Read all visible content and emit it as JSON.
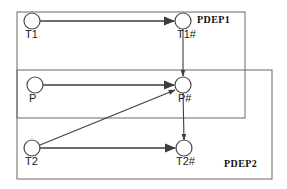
{
  "diagram": {
    "type": "petri-net-dependency-graph",
    "width": 287,
    "height": 189,
    "background_color": "#ffffff",
    "line_color": "#3d3d3d",
    "box_color": "#6b6b6b",
    "node_stroke_color": "#4a4a4a",
    "node_fill_color": "#ffffff",
    "label_color": "#1a1a1a"
  },
  "regions": [
    {
      "id": "pdep1",
      "label": "PDEP1",
      "x": 17,
      "y": 12,
      "width": 228,
      "height": 106,
      "label_x": 197,
      "label_y": 16
    },
    {
      "id": "pdep2",
      "label": "PDEP2",
      "x": 17,
      "y": 70,
      "width": 255,
      "height": 109,
      "label_x": 224,
      "label_y": 160
    }
  ],
  "nodes": [
    {
      "id": "t1",
      "label": "T1",
      "cx": 32,
      "cy": 21,
      "r": 8,
      "label_x": 25,
      "label_y": 30
    },
    {
      "id": "t1h",
      "label": "T1#",
      "cx": 183,
      "cy": 21,
      "r": 8,
      "label_x": 177,
      "label_y": 30
    },
    {
      "id": "p",
      "label": "P",
      "cx": 35,
      "cy": 85,
      "r": 8,
      "label_x": 29,
      "label_y": 94
    },
    {
      "id": "ph",
      "label": "P#",
      "cx": 183,
      "cy": 85,
      "r": 8,
      "label_x": 178,
      "label_y": 94
    },
    {
      "id": "t2",
      "label": "T2",
      "cx": 32,
      "cy": 148,
      "r": 8,
      "label_x": 25,
      "label_y": 157
    },
    {
      "id": "t2h",
      "label": "T2#",
      "cx": 184,
      "cy": 148,
      "r": 8,
      "label_x": 176,
      "label_y": 157
    }
  ],
  "edges": [
    {
      "id": "t1-to-t1h",
      "from": "T1",
      "to": "T1#",
      "x1": 40,
      "y1": 21,
      "x2": 174,
      "y2": 21,
      "style": "thick"
    },
    {
      "id": "p-to-ph",
      "from": "P",
      "to": "P#",
      "x1": 43,
      "y1": 85,
      "x2": 174,
      "y2": 85,
      "style": "thick"
    },
    {
      "id": "t2-to-t2h",
      "from": "T2",
      "to": "T2#",
      "x1": 40,
      "y1": 148,
      "x2": 175,
      "y2": 148,
      "style": "thick"
    },
    {
      "id": "t1h-to-ph",
      "from": "T1#",
      "to": "P#",
      "x1": 183,
      "y1": 29,
      "x2": 183,
      "y2": 76,
      "style": "thin"
    },
    {
      "id": "ph-to-t2h",
      "from": "P#",
      "to": "T2#",
      "x1": 183,
      "y1": 93,
      "x2": 184,
      "y2": 140,
      "style": "thin"
    },
    {
      "id": "t2-to-ph",
      "from": "T2",
      "to": "P#",
      "x1": 40,
      "y1": 145,
      "x2": 175,
      "y2": 90,
      "style": "thin"
    }
  ]
}
